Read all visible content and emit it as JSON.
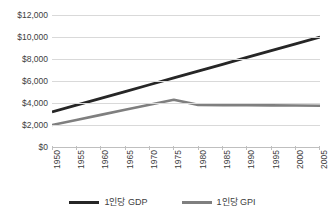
{
  "chart_data": {
    "type": "line",
    "title": "",
    "subtitle": "",
    "xlabel": "",
    "ylabel": "",
    "grid": true,
    "legend_position": "bottom",
    "x": [
      "1950",
      "1955",
      "1960",
      "1965",
      "1970",
      "1975",
      "1980",
      "1985",
      "1990",
      "1995",
      "2000",
      "2005"
    ],
    "categories": [
      "1950",
      "1955",
      "1960",
      "1965",
      "1970",
      "1975",
      "1980",
      "1985",
      "1990",
      "1995",
      "2000",
      "2005"
    ],
    "ylim": [
      0,
      12000
    ],
    "ytick_values": [
      0,
      2000,
      4000,
      6000,
      8000,
      10000,
      12000
    ],
    "ytick_labels": [
      "$0",
      "$2,000",
      "$4,000",
      "$6,000",
      "$8,000",
      "$10,000",
      "$12,000"
    ],
    "series": [
      {
        "name": "1인당 GDP",
        "color": "#262626",
        "values": [
          3180,
          3800,
          4420,
          5040,
          5660,
          6280,
          6900,
          7520,
          8140,
          8760,
          9380,
          10000
        ]
      },
      {
        "name": "1인당 GPI",
        "color": "#7f7f7f",
        "values": [
          2000,
          2460,
          2920,
          3380,
          3840,
          4300,
          3830,
          3800,
          3790,
          3780,
          3770,
          3750
        ]
      }
    ]
  },
  "legend": {
    "entries": [
      {
        "label": "1인당 GDP",
        "color": "#262626"
      },
      {
        "label": "1인당 GPI",
        "color": "#7f7f7f"
      }
    ]
  },
  "axes": {
    "y": {
      "labels": [
        "$12,000",
        "$10,000",
        "$8,000",
        "$6,000",
        "$4,000",
        "$2,000",
        "$0"
      ]
    },
    "x": {
      "labels": [
        "1950",
        "1955",
        "1960",
        "1965",
        "1970",
        "1975",
        "1980",
        "1985",
        "1990",
        "1995",
        "2000",
        "2005"
      ]
    }
  },
  "colors": {
    "gridline": "#d9d9d9",
    "axis": "#bfbfbf",
    "text": "#3d3d3d",
    "background": "#ffffff",
    "series_gdp": "#262626",
    "series_gpi": "#7f7f7f"
  }
}
